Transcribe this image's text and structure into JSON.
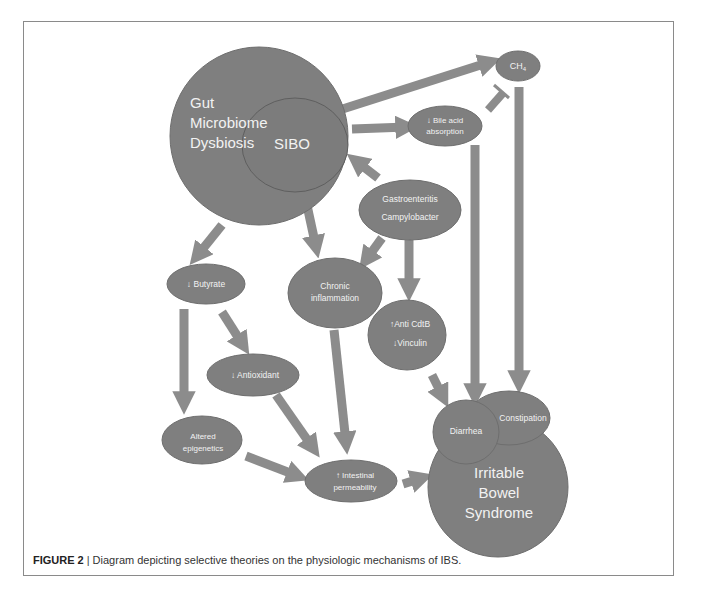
{
  "figure": {
    "caption_label": "FIGURE 2",
    "caption_separator": "|",
    "caption_text": "Diagram depicting selective theories on the physiologic mechanisms of IBS."
  },
  "colors": {
    "node_fill": "#7f7f7f",
    "arrow_fill": "#8c8c8c",
    "node_text": "#f2f2f2",
    "border": "#8a8a8a"
  },
  "nodes": {
    "gut": {
      "line1": "Gut",
      "line2": "Microbiome",
      "line3": "Dysbiosis"
    },
    "sibo": {
      "label": "SIBO"
    },
    "ch4": {
      "label": "CH",
      "sub": "4"
    },
    "bile": {
      "line1": "↓ Bile acid",
      "line2": "absorption"
    },
    "gastro": {
      "line1": "Gastroenteritis",
      "line2": "Campylobacter"
    },
    "butyrate": {
      "label": "↓ Butyrate"
    },
    "chronic": {
      "line1": "Chronic",
      "line2": "inflammation"
    },
    "anticdtb": {
      "line1": "↑Anti CdtB",
      "line2": "↓Vinculin"
    },
    "antioxidant": {
      "label": "↓ Antioxidant"
    },
    "epigenetics": {
      "line1": "Altered",
      "line2": "epigenetics"
    },
    "permeability": {
      "line1": "↑ Intestinal",
      "line2": "permeability"
    },
    "diarrhea": {
      "label": "Diarrhea"
    },
    "constipation": {
      "label": "Constipation"
    },
    "ibs": {
      "line1": "Irritable",
      "line2": "Bowel",
      "line3": "Syndrome"
    }
  },
  "edges": [
    {
      "from": "SIBO",
      "to": "CH4",
      "type": "arrow"
    },
    {
      "from": "Gut Microbiome Dysbiosis",
      "to": "Bile acid absorption",
      "type": "arrow"
    },
    {
      "from": "CH4",
      "to": "Bile acid absorption",
      "type": "inhibit"
    },
    {
      "from": "Gastroenteritis",
      "to": "SIBO",
      "type": "arrow"
    },
    {
      "from": "Gut Microbiome Dysbiosis",
      "to": "Butyrate",
      "type": "arrow"
    },
    {
      "from": "SIBO",
      "to": "Chronic inflammation",
      "type": "arrow"
    },
    {
      "from": "Gastroenteritis",
      "to": "Chronic inflammation",
      "type": "arrow"
    },
    {
      "from": "Gastroenteritis",
      "to": "Anti CdtB / Vinculin",
      "type": "arrow"
    },
    {
      "from": "Butyrate",
      "to": "Antioxidant",
      "type": "arrow"
    },
    {
      "from": "Butyrate",
      "to": "Altered epigenetics",
      "type": "arrow"
    },
    {
      "from": "Antioxidant",
      "to": "Intestinal permeability",
      "type": "arrow"
    },
    {
      "from": "Chronic inflammation",
      "to": "Intestinal permeability",
      "type": "arrow"
    },
    {
      "from": "Altered epigenetics",
      "to": "Intestinal permeability",
      "type": "arrow"
    },
    {
      "from": "Intestinal permeability",
      "to": "IBS",
      "type": "arrow"
    },
    {
      "from": "Anti CdtB / Vinculin",
      "to": "Diarrhea",
      "type": "arrow"
    },
    {
      "from": "Bile acid absorption",
      "to": "Diarrhea",
      "type": "arrow"
    },
    {
      "from": "CH4",
      "to": "Constipation",
      "type": "arrow"
    }
  ]
}
